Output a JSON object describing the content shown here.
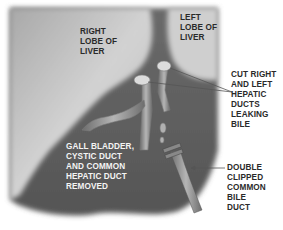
{
  "diagram": {
    "title": "",
    "colors": {
      "liver_light": "#c9c9c9",
      "liver_dark": "#5e5e5e",
      "duct": "#9a9a9a",
      "text_light": "#f4f4f4",
      "text_dark": "#2a2a2a",
      "leader_line": "#555555",
      "background": "#ffffff"
    },
    "labels": {
      "right_lobe": "RIGHT\nLOBE OF\nLIVER",
      "left_lobe": "LEFT\nLOBE OF\nLIVER",
      "cut_ducts": "CUT RIGHT\nAND LEFT\nHEPATIC\nDUCTS\nLEAKING\nBILE",
      "removed": "GALL BLADDER,\nCYSTIC DUCT\nAND COMMON\nHEPATIC DUCT\nREMOVED",
      "clipped_duct": "DOUBLE\nCLIPPED\nCOMMON\nBILE\nDUCT"
    }
  }
}
